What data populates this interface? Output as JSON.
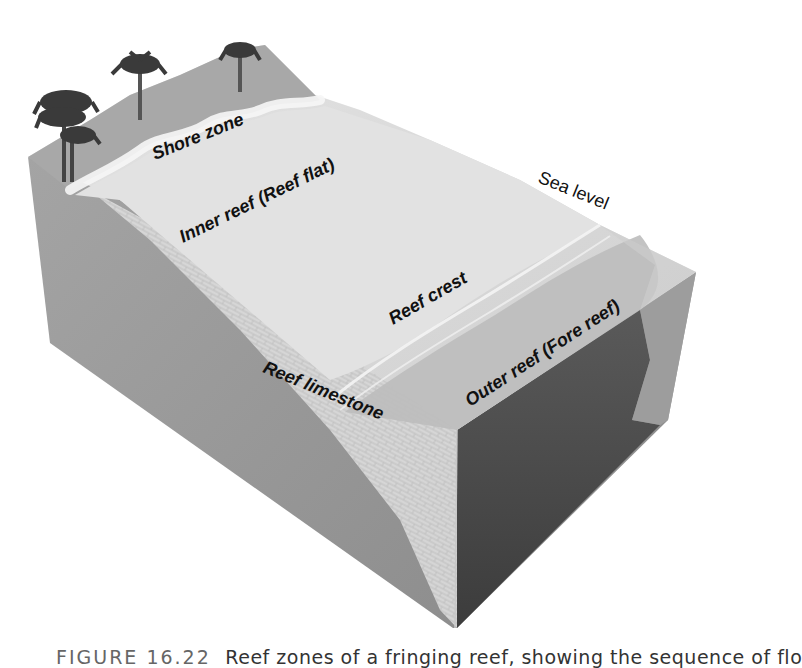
{
  "figure": {
    "labels": {
      "shore_zone": "Shore zone",
      "inner_reef": "Inner reef (Reef flat)",
      "sea_level": "Sea level",
      "reef_crest": "Reef crest",
      "reef_limestone": "Reef limestone",
      "outer_reef": "Outer reef (Fore reef)"
    },
    "icons": [
      "palm-tree-icon",
      "palm-tree-icon",
      "palm-tree-icon",
      "palm-tree-cluster-icon"
    ],
    "colors": {
      "sand_dark": "#a9a9a9",
      "sand_light": "#e6e6e6",
      "reef_flat": "#d4d4d4",
      "left_face": "#9a9a9a",
      "limestone": "#d8d8d8",
      "deep_water": "#4a4a4a",
      "right_face": "#8f8f8f",
      "palm": "#3a3a3a"
    }
  },
  "caption": {
    "figure_number": "FIGURE 16.22",
    "text": "Reef zones of a fringing reef, showing the sequence of flo"
  }
}
